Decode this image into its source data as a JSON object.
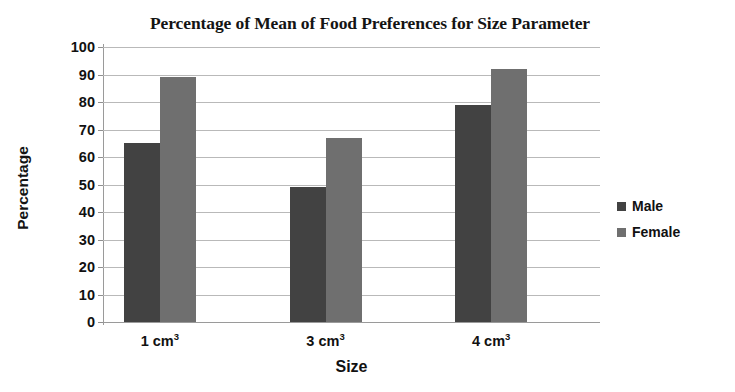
{
  "chart_data": {
    "type": "bar",
    "title": "Percentage of Mean of Food Preferences for Size Parameter",
    "xlabel": "Size",
    "ylabel": "Percentage",
    "categories": [
      "1 cm³",
      "3 cm³",
      "4 cm³"
    ],
    "category_parts": [
      {
        "base": "1 cm",
        "sup": "3"
      },
      {
        "base": "3 cm",
        "sup": "3"
      },
      {
        "base": "4 cm",
        "sup": "3"
      }
    ],
    "series": [
      {
        "name": "Male",
        "values": [
          65,
          49,
          79
        ],
        "color": "#424242"
      },
      {
        "name": "Female",
        "values": [
          89,
          67,
          92
        ],
        "color": "#6f6f6f"
      }
    ],
    "ylim": [
      0,
      100
    ],
    "ytick_step": 10,
    "yticks": [
      100,
      90,
      80,
      70,
      60,
      50,
      40,
      30,
      20,
      10,
      0
    ],
    "ytick_labels": [
      "100",
      "90",
      "80",
      "70",
      "60",
      "50",
      "40",
      "30",
      "20",
      "10",
      "0"
    ],
    "grid": true,
    "grid_axis": "y",
    "legend_position": "right"
  },
  "legend": {
    "entries": [
      {
        "label": "Male",
        "swatch": "male-swatch-icon"
      },
      {
        "label": "Female",
        "swatch": "female-swatch-icon"
      }
    ]
  }
}
